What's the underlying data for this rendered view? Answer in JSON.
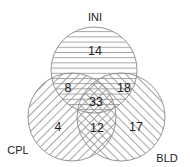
{
  "diagram": {
    "type": "venn-3",
    "sets": [
      {
        "name": "INI",
        "label": "INI",
        "pattern": "horizontal-lines"
      },
      {
        "name": "CPL",
        "label": "CPL",
        "pattern": "forward-diagonal"
      },
      {
        "name": "BLD",
        "label": "BLD",
        "pattern": "backward-diagonal"
      }
    ],
    "regions": {
      "INI_only": "14",
      "INI_CPL": "8",
      "INI_BLD": "18",
      "INI_CPL_BLD": "33",
      "CPL_only": "4",
      "CPL_BLD": "12",
      "BLD_only": "17"
    },
    "colors": {
      "outline": "#8a8a8a",
      "hatch": "#9a9a9a",
      "text": "#222222",
      "background": "#ffffff"
    }
  }
}
